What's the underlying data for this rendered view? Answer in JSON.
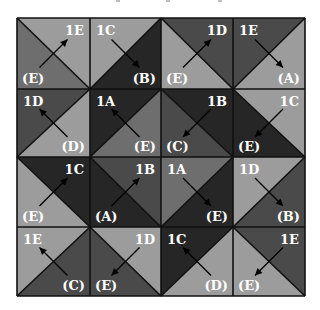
{
  "diagram": {
    "type": "quilt-tile-grid",
    "rows": 4,
    "cols": 4,
    "grid": {
      "x": 17,
      "y": 18,
      "col_edges": [
        17,
        90,
        161,
        233,
        305
      ],
      "row_edges": [
        18,
        89,
        157,
        227,
        296
      ]
    },
    "palette": {
      "very_dark": "#262626",
      "dark": "#4a4a4a",
      "medium": "#6e6e6e",
      "light": "#9c9c9c",
      "line": "#111111",
      "text": "#ffffff"
    },
    "tiles": [
      {
        "row": 0,
        "col": 0,
        "diagonal": "tl-br",
        "fill_a": "light",
        "fill_b": "medium",
        "top_label": "1E",
        "bottom_label": "(E)",
        "arrow": "up-right"
      },
      {
        "row": 0,
        "col": 1,
        "diagonal": "bl-tr",
        "fill_a": "light",
        "fill_b": "very_dark",
        "top_label": "1C",
        "bottom_label": "(B)",
        "arrow": "down-right"
      },
      {
        "row": 0,
        "col": 2,
        "diagonal": "tl-br",
        "fill_a": "dark",
        "fill_b": "light",
        "top_label": "1D",
        "bottom_label": "(E)",
        "arrow": "up-right"
      },
      {
        "row": 0,
        "col": 3,
        "diagonal": "bl-tr",
        "fill_a": "dark",
        "fill_b": "light",
        "top_label": "1E",
        "bottom_label": "(A)",
        "arrow": "down-right"
      },
      {
        "row": 1,
        "col": 0,
        "diagonal": "bl-tr",
        "fill_a": "dark",
        "fill_b": "light",
        "top_label": "1D",
        "bottom_label": "(D)",
        "arrow": "up-left"
      },
      {
        "row": 1,
        "col": 1,
        "diagonal": "bl-tr",
        "fill_a": "very_dark",
        "fill_b": "medium",
        "top_label": "1A",
        "bottom_label": "(E)",
        "arrow": "up-left"
      },
      {
        "row": 1,
        "col": 2,
        "diagonal": "tl-br",
        "fill_a": "very_dark",
        "fill_b": "dark",
        "top_label": "1B",
        "bottom_label": "(C)",
        "arrow": "down-left"
      },
      {
        "row": 1,
        "col": 3,
        "diagonal": "tl-br",
        "fill_a": "light",
        "fill_b": "very_dark",
        "top_label": "1C",
        "bottom_label": "(E)",
        "arrow": "down-left"
      },
      {
        "row": 2,
        "col": 0,
        "diagonal": "tl-br",
        "fill_a": "very_dark",
        "fill_b": "light",
        "top_label": "1C",
        "bottom_label": "(E)",
        "arrow": "up-right"
      },
      {
        "row": 2,
        "col": 1,
        "diagonal": "tl-br",
        "fill_a": "dark",
        "fill_b": "very_dark",
        "top_label": "1B",
        "bottom_label": "(A)",
        "arrow": "up-right"
      },
      {
        "row": 2,
        "col": 2,
        "diagonal": "bl-tr",
        "fill_a": "medium",
        "fill_b": "very_dark",
        "top_label": "1A",
        "bottom_label": "(E)",
        "arrow": "down-right"
      },
      {
        "row": 2,
        "col": 3,
        "diagonal": "bl-tr",
        "fill_a": "light",
        "fill_b": "dark",
        "top_label": "1D",
        "bottom_label": "(B)",
        "arrow": "down-right"
      },
      {
        "row": 3,
        "col": 0,
        "diagonal": "bl-tr",
        "fill_a": "light",
        "fill_b": "dark",
        "top_label": "1E",
        "bottom_label": "(C)",
        "arrow": "up-left"
      },
      {
        "row": 3,
        "col": 1,
        "diagonal": "tl-br",
        "fill_a": "light",
        "fill_b": "dark",
        "top_label": "1D",
        "bottom_label": "(E)",
        "arrow": "down-left"
      },
      {
        "row": 3,
        "col": 2,
        "diagonal": "bl-tr",
        "fill_a": "very_dark",
        "fill_b": "light",
        "top_label": "1C",
        "bottom_label": "(D)",
        "arrow": "up-left"
      },
      {
        "row": 3,
        "col": 3,
        "diagonal": "tl-br",
        "fill_a": "dark",
        "fill_b": "light",
        "top_label": "1E",
        "bottom_label": "(E)",
        "arrow": "down-left"
      }
    ]
  }
}
